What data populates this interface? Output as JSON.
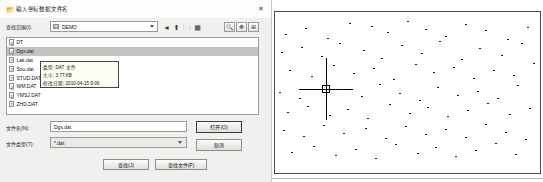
{
  "dialog": {
    "title": "输入坐标数据文件名",
    "title_icon": "folder-open-icon",
    "close_label": "✕",
    "lookin_label": "查找范围(I):",
    "lookin_value": "DEMO",
    "toolbar": [
      {
        "name": "back-icon",
        "glyph": "◄"
      },
      {
        "name": "up-folder-icon",
        "glyph": "⬆"
      },
      {
        "name": "new-folder-icon",
        "glyph": "🗀"
      },
      {
        "name": "views-icon",
        "glyph": "▦"
      }
    ],
    "preview_buttons": [
      {
        "name": "zoom-preview-button",
        "glyph": "🔍"
      },
      {
        "name": "pan-preview-button",
        "glyph": "✥"
      },
      {
        "name": "fit-preview-button",
        "glyph": "⊞"
      }
    ],
    "files": [
      {
        "name": "DT",
        "selected": false
      },
      {
        "name": "Dgx.dat",
        "selected": true
      },
      {
        "name": "Lak.dat",
        "selected": false
      },
      {
        "name": "Sou.dat",
        "selected": false
      },
      {
        "name": "STUD.DAT",
        "selected": false
      },
      {
        "name": "WM.DAT",
        "selected": false
      },
      {
        "name": "YMSJ.DAT",
        "selected": false
      },
      {
        "name": "ZHD.DAT",
        "selected": false
      }
    ],
    "tooltip": {
      "type_line": "类型: DAT 文件",
      "size_line": "大小: 3.77 KB",
      "date_line": "修改日期: 2010-04-15 9:06"
    },
    "filename_label": "文件名(N):",
    "filename_value": "Dgx.dat",
    "filetype_label": "文件类型(T):",
    "filetype_value": "*.dat",
    "open_button": "打开(O)",
    "cancel_button": "取消",
    "extra_button_1": "查找(J)",
    "extra_button_2": "查找文件(P)"
  },
  "cad": {
    "label": "survey-point-drawing",
    "crosshair": "crosshair-cursor",
    "points": [
      [
        10,
        22
      ],
      [
        30,
        16
      ],
      [
        52,
        26
      ],
      [
        74,
        11
      ],
      [
        96,
        14
      ],
      [
        112,
        20
      ],
      [
        132,
        9
      ],
      [
        150,
        17
      ],
      [
        170,
        24
      ],
      [
        190,
        12
      ],
      [
        210,
        18
      ],
      [
        232,
        27
      ],
      [
        252,
        15
      ],
      [
        6,
        40
      ],
      [
        26,
        35
      ],
      [
        46,
        44
      ],
      [
        64,
        31
      ],
      [
        88,
        38
      ],
      [
        106,
        46
      ],
      [
        126,
        33
      ],
      [
        146,
        41
      ],
      [
        164,
        29
      ],
      [
        186,
        47
      ],
      [
        204,
        36
      ],
      [
        226,
        43
      ],
      [
        246,
        31
      ],
      [
        14,
        58
      ],
      [
        36,
        64
      ],
      [
        58,
        53
      ],
      [
        78,
        61
      ],
      [
        98,
        56
      ],
      [
        118,
        67
      ],
      [
        140,
        52
      ],
      [
        158,
        60
      ],
      [
        178,
        55
      ],
      [
        198,
        66
      ],
      [
        218,
        58
      ],
      [
        238,
        63
      ],
      [
        258,
        51
      ],
      [
        4,
        80
      ],
      [
        24,
        86
      ],
      [
        66,
        77
      ],
      [
        86,
        84
      ],
      [
        104,
        72
      ],
      [
        124,
        81
      ],
      [
        144,
        88
      ],
      [
        162,
        75
      ],
      [
        182,
        83
      ],
      [
        202,
        79
      ],
      [
        222,
        86
      ],
      [
        242,
        73
      ],
      [
        12,
        100
      ],
      [
        32,
        94
      ],
      [
        54,
        103
      ],
      [
        72,
        97
      ],
      [
        92,
        106
      ],
      [
        114,
        92
      ],
      [
        134,
        101
      ],
      [
        152,
        95
      ],
      [
        172,
        104
      ],
      [
        192,
        98
      ],
      [
        212,
        91
      ],
      [
        234,
        102
      ],
      [
        254,
        96
      ],
      [
        8,
        118
      ],
      [
        28,
        124
      ],
      [
        48,
        113
      ],
      [
        68,
        121
      ],
      [
        90,
        116
      ],
      [
        110,
        126
      ],
      [
        130,
        114
      ],
      [
        150,
        122
      ],
      [
        170,
        117
      ],
      [
        190,
        125
      ],
      [
        210,
        112
      ],
      [
        230,
        120
      ],
      [
        250,
        127
      ],
      [
        16,
        140
      ],
      [
        38,
        134
      ],
      [
        60,
        143
      ],
      [
        80,
        137
      ],
      [
        100,
        146
      ],
      [
        120,
        132
      ],
      [
        142,
        141
      ],
      [
        160,
        135
      ],
      [
        180,
        144
      ],
      [
        200,
        138
      ],
      [
        220,
        131
      ],
      [
        240,
        142
      ]
    ]
  }
}
